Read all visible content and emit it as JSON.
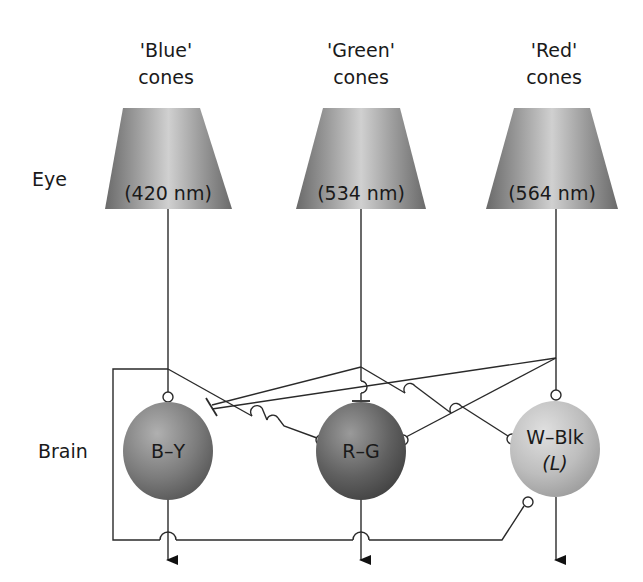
{
  "diagram": {
    "rows": {
      "eye_label": "Eye",
      "brain_label": "Brain"
    },
    "cones": [
      {
        "id": "blue",
        "label_line1": "'Blue'",
        "label_line2": "cones",
        "wavelength": "(420 nm)"
      },
      {
        "id": "green",
        "label_line1": "'Green'",
        "label_line2": "cones",
        "wavelength": "(534 nm)"
      },
      {
        "id": "red",
        "label_line1": "'Red'",
        "label_line2": "cones",
        "wavelength": "(564 nm)"
      }
    ],
    "channels": [
      {
        "id": "blue-yellow",
        "label": "B–Y",
        "sublabel": ""
      },
      {
        "id": "red-green",
        "label": "R–G",
        "sublabel": ""
      },
      {
        "id": "white-black",
        "label": "W–Blk",
        "sublabel": "(L)"
      }
    ],
    "connections": [
      {
        "from": "blue",
        "to": "blue-yellow",
        "type": "excitatory"
      },
      {
        "from": "blue",
        "to": "red-green",
        "type": "excitatory"
      },
      {
        "from": "blue",
        "to": "white-black",
        "type": "excitatory",
        "route": "feedback-loop-below"
      },
      {
        "from": "green",
        "to": "blue-yellow",
        "type": "inhibitory"
      },
      {
        "from": "green",
        "to": "red-green",
        "type": "inhibitory"
      },
      {
        "from": "green",
        "to": "white-black",
        "type": "excitatory"
      },
      {
        "from": "red",
        "to": "blue-yellow",
        "type": "inhibitory"
      },
      {
        "from": "red",
        "to": "red-green",
        "type": "excitatory"
      },
      {
        "from": "red",
        "to": "white-black",
        "type": "excitatory"
      }
    ],
    "colors": {
      "cone_dark": "#6e6e6e",
      "cone_light": "#c9c9c9",
      "by_cell": "#7a7a7a",
      "rg_cell": "#5e5e5e",
      "wblk_cell": "#b9b9b9",
      "line": "#2a2a2a"
    }
  }
}
